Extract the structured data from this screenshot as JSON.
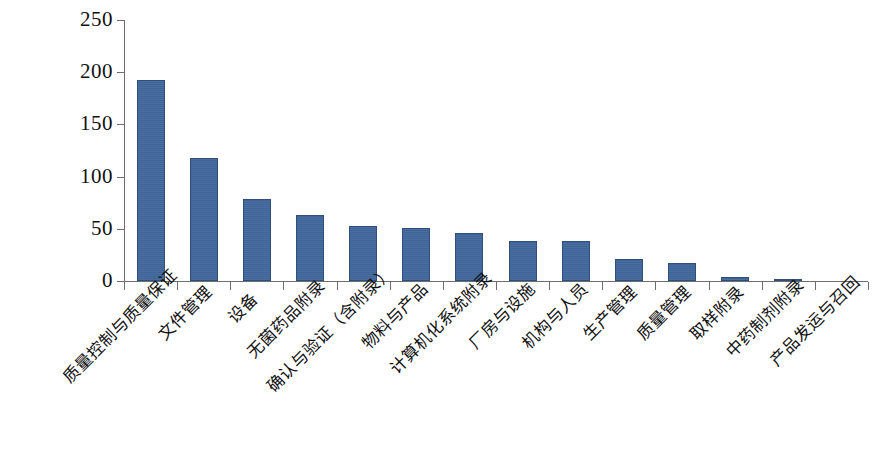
{
  "chart_data": {
    "type": "bar",
    "title": "",
    "subtitle": "",
    "xlabel": "",
    "ylabel": "",
    "ylim": [
      0,
      250
    ],
    "ytick_values": [
      250,
      200,
      150,
      100,
      50,
      0
    ],
    "ytick_labels": [
      "250",
      "200",
      "150",
      "100",
      "50",
      "0"
    ],
    "grid": false,
    "legend": null,
    "bar_color": "#41679c",
    "bar_edge_color": "#2f4e78",
    "axis_color": "#6d6d6d",
    "categories": [
      "质量控制与质量保证",
      "文件管理",
      "设备",
      "无菌药品附录",
      "确认与验证（含附录）",
      "物料与产品",
      "计算机化系统附录",
      "厂房与设施",
      "机构与人员",
      "生产管理",
      "质量管理",
      "取样附录",
      "中药制剂附录",
      "产品发运与召回"
    ],
    "values": [
      193,
      118,
      79,
      63,
      53,
      51,
      46,
      38,
      38,
      21,
      17,
      4,
      1,
      0
    ]
  }
}
